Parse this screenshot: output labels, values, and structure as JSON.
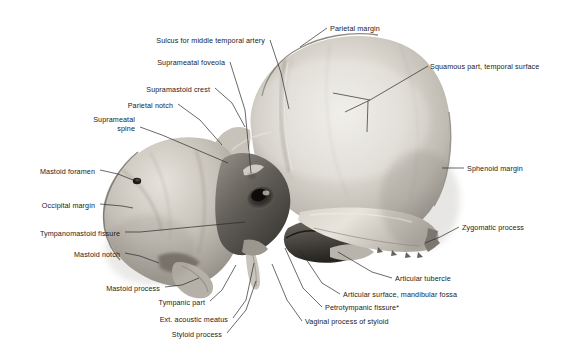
{
  "figure": {
    "background_color": "#ffffff",
    "text_color": "#1b1b1b",
    "leader_color": "#2a2a2a",
    "width": 570,
    "height": 356,
    "footnote_marker": "*"
  },
  "labels": [
    {
      "id": "parietal-margin",
      "text": "Parietal margin",
      "align": "left",
      "x": 330,
      "y": 24,
      "leader": [
        [
          327,
          28
        ],
        [
          310,
          40
        ],
        [
          300,
          47
        ]
      ]
    },
    {
      "id": "sulcus-middle-temporal-artery",
      "text": "Sulcus for middle temporal artery",
      "align": "right",
      "x": 265,
      "y": 36,
      "leader": [
        [
          270,
          40
        ],
        [
          281,
          73
        ],
        [
          289,
          109
        ]
      ]
    },
    {
      "id": "squamous-part-temporal-surface",
      "text": "Squamous part, temporal surface",
      "align": "left",
      "x": 430,
      "y": 62,
      "leader": [
        [
          428,
          66
        ],
        [
          370,
          100
        ],
        [
          345,
          112
        ]
      ],
      "leader2": [
        [
          370,
          100
        ],
        [
          333,
          93
        ]
      ],
      "leader3": [
        [
          368,
          101
        ],
        [
          367,
          132
        ]
      ]
    },
    {
      "id": "suprameatal-foveola",
      "text": "Suprameatal foveola",
      "align": "right",
      "x": 225,
      "y": 58,
      "leader": [
        [
          230,
          62
        ],
        [
          245,
          110
        ],
        [
          251,
          173
        ]
      ]
    },
    {
      "id": "supramastoid-crest",
      "text": "Supramastoid crest",
      "align": "right",
      "x": 210,
      "y": 85,
      "leader": [
        [
          215,
          88
        ],
        [
          232,
          103
        ],
        [
          245,
          127
        ]
      ]
    },
    {
      "id": "parietal-notch",
      "text": "Parietal notch",
      "align": "right",
      "x": 173,
      "y": 101,
      "leader": [
        [
          178,
          104
        ],
        [
          200,
          120
        ],
        [
          222,
          145
        ]
      ]
    },
    {
      "id": "suprameatal-spine",
      "text": "Suprameatal\nspine",
      "align": "right",
      "x": 135,
      "y": 115,
      "two_line": true,
      "leader": [
        [
          140,
          127
        ],
        [
          162,
          135
        ],
        [
          228,
          163
        ]
      ]
    },
    {
      "id": "sphenoid-margin",
      "text": "Sphenoid margin",
      "align": "left",
      "x": 467,
      "y": 164,
      "leader": [
        [
          464,
          168
        ],
        [
          442,
          168
        ]
      ]
    },
    {
      "id": "mastoid-foramen",
      "text": "Mastoid foramen",
      "align": "right",
      "x": 95,
      "y": 167,
      "leader": [
        [
          100,
          170
        ],
        [
          118,
          174
        ],
        [
          133,
          180
        ]
      ]
    },
    {
      "id": "occipital-margin",
      "text": "Occipital margin",
      "align": "right",
      "x": 95,
      "y": 201,
      "leader": [
        [
          100,
          204
        ],
        [
          122,
          206
        ],
        [
          133,
          208
        ]
      ]
    },
    {
      "id": "tympanomastoid-fissure",
      "text": "Tympanomastoid fissure",
      "align": "right",
      "x": 120,
      "y": 229,
      "leader": [
        [
          125,
          232
        ],
        [
          140,
          232
        ],
        [
          245,
          222
        ]
      ]
    },
    {
      "id": "zygomatic-process",
      "text": "Zygomatic process",
      "align": "left",
      "x": 462,
      "y": 223,
      "leader": [
        [
          459,
          227
        ],
        [
          440,
          237
        ],
        [
          425,
          243
        ]
      ]
    },
    {
      "id": "mastoid-notch",
      "text": "Mastoid notch",
      "align": "right",
      "x": 120,
      "y": 250,
      "leader": [
        [
          125,
          253
        ],
        [
          140,
          256
        ],
        [
          159,
          263
        ]
      ]
    },
    {
      "id": "articular-tubercle",
      "text": "Articular tubercle",
      "align": "left",
      "x": 395,
      "y": 274,
      "leader": [
        [
          392,
          278
        ],
        [
          372,
          272
        ],
        [
          338,
          252
        ]
      ]
    },
    {
      "id": "mastoid-process",
      "text": "Mastoid process",
      "align": "right",
      "x": 160,
      "y": 284,
      "leader": [
        [
          165,
          287
        ],
        [
          182,
          285
        ],
        [
          199,
          278
        ]
      ]
    },
    {
      "id": "articular-surface-mandibular-fossa",
      "text": "Articular surface, mandibular fossa",
      "align": "left",
      "x": 343,
      "y": 290,
      "leader": [
        [
          340,
          294
        ],
        [
          322,
          283
        ],
        [
          300,
          250
        ]
      ]
    },
    {
      "id": "tympanic-part",
      "text": "Tympanic part",
      "align": "right",
      "x": 205,
      "y": 298,
      "leader": [
        [
          210,
          301
        ],
        [
          222,
          290
        ],
        [
          236,
          265
        ]
      ]
    },
    {
      "id": "petrotympanic-fissure",
      "text": "Petrotympanic fissure*",
      "align": "left",
      "x": 325,
      "y": 303,
      "leader": [
        [
          322,
          307
        ],
        [
          303,
          288
        ],
        [
          285,
          248
        ]
      ]
    },
    {
      "id": "ext-acoustic-meatus",
      "text": "Ext. acoustic meatus",
      "align": "right",
      "x": 228,
      "y": 315,
      "leader": [
        [
          233,
          318
        ],
        [
          246,
          300
        ],
        [
          254,
          263
        ]
      ]
    },
    {
      "id": "vaginal-process-of-styloid",
      "text": "Vaginal process of styloid",
      "align": "left",
      "x": 305,
      "y": 317,
      "leader": [
        [
          302,
          321
        ],
        [
          287,
          300
        ],
        [
          272,
          264
        ]
      ]
    },
    {
      "id": "styloid-process",
      "text": "Styloid process",
      "align": "right",
      "x": 222,
      "y": 330,
      "leader": [
        [
          227,
          333
        ],
        [
          246,
          310
        ],
        [
          256,
          281
        ]
      ]
    }
  ]
}
